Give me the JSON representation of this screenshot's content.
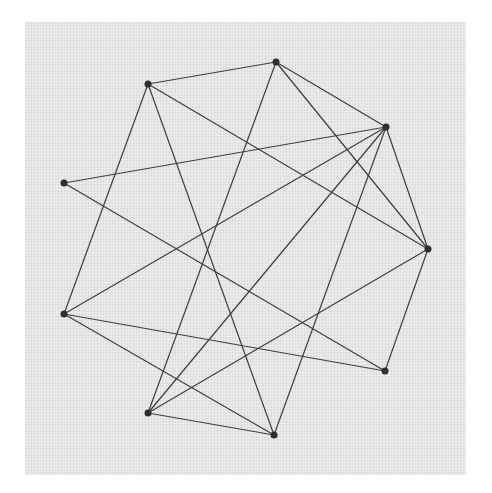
{
  "diagram": {
    "type": "undirected-graph",
    "background_color": "#e5e5e5",
    "edge_color": "#3f3f3f",
    "node_color": "#2e2e2e",
    "node_radius": 3.5,
    "nodes": [
      {
        "id": "A",
        "x": 148,
        "y": 84
      },
      {
        "id": "B",
        "x": 276,
        "y": 62
      },
      {
        "id": "C",
        "x": 386,
        "y": 127
      },
      {
        "id": "D",
        "x": 428,
        "y": 249
      },
      {
        "id": "E",
        "x": 385,
        "y": 371
      },
      {
        "id": "F",
        "x": 274,
        "y": 435
      },
      {
        "id": "G",
        "x": 148,
        "y": 413
      },
      {
        "id": "H",
        "x": 64,
        "y": 183
      },
      {
        "id": "I",
        "x": 64,
        "y": 314
      }
    ],
    "edges": [
      [
        "A",
        "B"
      ],
      [
        "A",
        "D"
      ],
      [
        "A",
        "I"
      ],
      [
        "A",
        "F"
      ],
      [
        "B",
        "C"
      ],
      [
        "B",
        "D"
      ],
      [
        "B",
        "G"
      ],
      [
        "C",
        "H"
      ],
      [
        "C",
        "I"
      ],
      [
        "C",
        "G"
      ],
      [
        "C",
        "F"
      ],
      [
        "C",
        "D"
      ],
      [
        "D",
        "E"
      ],
      [
        "D",
        "G"
      ],
      [
        "H",
        "E"
      ],
      [
        "I",
        "E"
      ],
      [
        "I",
        "F"
      ],
      [
        "G",
        "F"
      ]
    ]
  }
}
